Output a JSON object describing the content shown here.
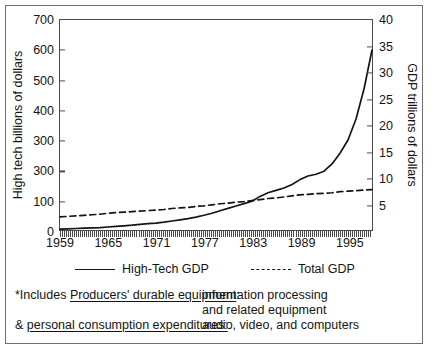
{
  "chart_data": {
    "type": "line",
    "title": "",
    "xlabel": "",
    "ylabel": "High tech billions of dollars",
    "y2label": "GDP trillions of dollars",
    "xlim": [
      1959,
      1998
    ],
    "ylim": [
      0,
      700
    ],
    "y2lim": [
      0,
      40
    ],
    "grid": false,
    "legend_position": "below",
    "x_tick_labels": [
      "1959",
      "1965",
      "1971",
      "1977",
      "1983",
      "1989",
      "1995"
    ],
    "x_tick_values": [
      1959,
      1965,
      1971,
      1977,
      1983,
      1989,
      1995
    ],
    "x_minor_ticks": "annual",
    "y_tick_labels": [
      "700",
      "600",
      "500",
      "400",
      "300",
      "300",
      "100",
      "0"
    ],
    "y_tick_values": [
      700,
      600,
      500,
      400,
      300,
      200,
      100,
      0
    ],
    "y2_tick_labels": [
      "40",
      "35",
      "30",
      "25",
      "20",
      "15",
      "10",
      "5"
    ],
    "y2_tick_values": [
      40,
      35,
      30,
      25,
      20,
      15,
      10,
      5
    ],
    "x": [
      1959,
      1960,
      1961,
      1962,
      1963,
      1964,
      1965,
      1966,
      1967,
      1968,
      1969,
      1970,
      1971,
      1972,
      1973,
      1974,
      1975,
      1976,
      1977,
      1978,
      1979,
      1980,
      1981,
      1982,
      1983,
      1984,
      1985,
      1986,
      1987,
      1988,
      1989,
      1990,
      1991,
      1992,
      1993,
      1994,
      1995,
      1996,
      1997,
      1998
    ],
    "series": [
      {
        "name": "High-Tech GDP",
        "style": "solid",
        "axis": "left",
        "unit": "billions of dollars",
        "values": [
          3,
          4,
          5,
          6,
          7,
          8,
          10,
          12,
          14,
          16,
          19,
          21,
          23,
          26,
          30,
          34,
          38,
          43,
          49,
          56,
          64,
          72,
          80,
          88,
          96,
          112,
          124,
          132,
          140,
          152,
          168,
          180,
          186,
          196,
          220,
          256,
          300,
          370,
          470,
          600
        ]
      },
      {
        "name": "Total GDP",
        "style": "dashed",
        "axis": "right",
        "unit": "trillions of dollars",
        "values": [
          2.5,
          2.6,
          2.7,
          2.8,
          2.9,
          3.0,
          3.2,
          3.3,
          3.4,
          3.5,
          3.6,
          3.7,
          3.8,
          3.9,
          4.1,
          4.2,
          4.3,
          4.5,
          4.6,
          4.8,
          5.0,
          5.1,
          5.3,
          5.4,
          5.6,
          5.8,
          6.0,
          6.1,
          6.3,
          6.5,
          6.7,
          6.8,
          6.9,
          7.0,
          7.1,
          7.3,
          7.4,
          7.5,
          7.6,
          7.7
        ]
      }
    ],
    "annotations": [
      "High-Tech GDP crosses Total GDP curve near 1983",
      "High-Tech GDP rises steeply after 1993 reaching about 600 billion"
    ]
  },
  "legend": {
    "items": [
      {
        "label": "High-Tech GDP",
        "style": "solid"
      },
      {
        "label": "Total GDP",
        "style": "dashed"
      }
    ]
  },
  "footnote": {
    "line1_lead_prefix": "*Includes ",
    "line1_lead_underlined": "Producers' durable equipment",
    "line1_lead_suffix": ":",
    "line1_value": "information processing",
    "line2_value": "and related equipment",
    "line3_lead_prefix": "& ",
    "line3_lead_underlined": "personal consumption expenditures:",
    "line3_lead_suffix": "",
    "line3_value": "audio, video, and computers"
  },
  "colors": {
    "ink": "#141414",
    "axis": "#4a4a4a",
    "frame": "#6e6e6e",
    "background": "#ffffff"
  }
}
